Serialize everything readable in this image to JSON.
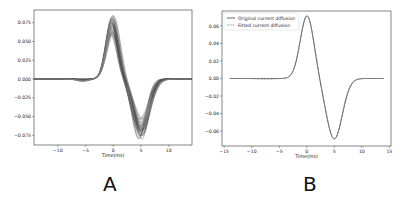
{
  "chart_data": [
    {
      "id": "A",
      "type": "line",
      "title": "",
      "xlabel": "Time(ms)",
      "ylabel": "",
      "xlim": [
        -14.3,
        14.2
      ],
      "ylim": [
        -0.088,
        0.092
      ],
      "xticks": [
        -10,
        -5,
        0,
        5,
        10
      ],
      "xtick_labels": [
        "−10",
        "−5",
        "0",
        "5",
        "10"
      ],
      "yticks": [
        0.075,
        0.05,
        0.025,
        0.0,
        -0.025,
        -0.05,
        -0.075
      ],
      "ytick_labels": [
        "0.075",
        "0.050",
        "0.025",
        "0.000",
        "−0.025",
        "−0.050",
        "−0.075"
      ],
      "grid": false,
      "legend": null,
      "description": "Many overlapping grey biphasic current diffusion traces; positive peak near t=0 (0.057–0.085), negative trough near t=5 (−0.052 to −0.080)",
      "series_color": "#555555",
      "series_count": 40,
      "peak_time_ms": 0,
      "peak_range": [
        0.057,
        0.085
      ],
      "trough_time_ms": 5,
      "trough_range": [
        -0.052,
        -0.08
      ],
      "approx_points_mean": {
        "x": [
          -14,
          -10,
          -6,
          -4,
          -2,
          -1,
          0,
          1,
          2,
          3,
          4,
          5,
          6,
          8,
          10,
          14
        ],
        "y": [
          0.0,
          0.0,
          -0.002,
          0.002,
          0.03,
          0.055,
          0.07,
          0.055,
          0.01,
          -0.04,
          -0.065,
          -0.068,
          -0.055,
          -0.02,
          -0.003,
          0.0
        ]
      }
    },
    {
      "id": "B",
      "type": "line",
      "title": "",
      "xlabel": "Time(ms)",
      "ylabel": "",
      "xlim": [
        -15.4,
        15.3
      ],
      "ylim": [
        -0.077,
        0.077
      ],
      "xticks": [
        -15,
        -10,
        -5,
        0,
        5,
        10,
        15
      ],
      "xtick_labels": [
        "−15",
        "−10",
        "−5",
        "0",
        "5",
        "10",
        "15"
      ],
      "yticks": [
        0.06,
        0.04,
        0.02,
        0.0,
        -0.02,
        -0.04,
        -0.06
      ],
      "ytick_labels": [
        "0.06",
        "0.04",
        "0.02",
        "0.00",
        "−0.02",
        "−0.04",
        "−0.06"
      ],
      "grid": false,
      "legend": {
        "position": "upper left",
        "entries": [
          {
            "label": "Original current diffusion",
            "style": "solid",
            "color": "#444444"
          },
          {
            "label": "Fitted current diffusion",
            "style": "dashed",
            "color": "#888888"
          }
        ]
      },
      "series": [
        {
          "name": "Original current diffusion",
          "x": [
            -14,
            -10,
            -6,
            -5,
            -4,
            -3,
            -2,
            -1,
            0,
            1,
            2,
            3,
            4,
            5,
            6,
            7,
            8,
            10,
            14
          ],
          "y": [
            0.0,
            0.0,
            0.0,
            0.002,
            0.01,
            0.025,
            0.045,
            0.063,
            0.07,
            0.06,
            0.025,
            -0.02,
            -0.055,
            -0.067,
            -0.058,
            -0.04,
            -0.022,
            -0.005,
            0.0
          ]
        },
        {
          "name": "Fitted current diffusion",
          "x": [
            -14,
            -10,
            -6,
            -5,
            -4,
            -3,
            -2,
            -1,
            0,
            1,
            2,
            3,
            4,
            5,
            6,
            7,
            8,
            10,
            14
          ],
          "y": [
            0.0,
            -0.001,
            -0.001,
            0.002,
            0.01,
            0.025,
            0.045,
            0.063,
            0.07,
            0.06,
            0.025,
            -0.02,
            -0.055,
            -0.067,
            -0.058,
            -0.04,
            -0.021,
            -0.003,
            0.0
          ]
        }
      ]
    }
  ],
  "panels": {
    "a_label": "A",
    "b_label": "B"
  }
}
